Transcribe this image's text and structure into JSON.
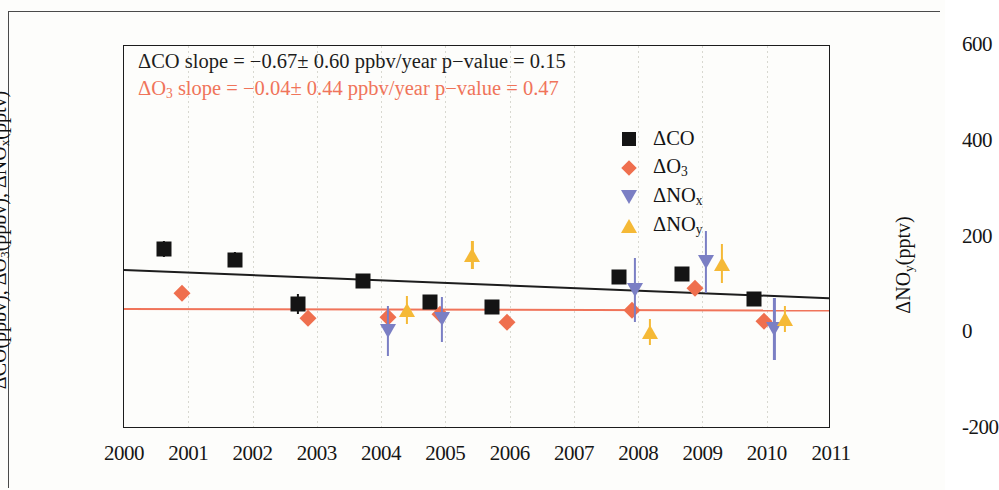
{
  "annotations": {
    "co_line": "ΔCO slope = −0.67± 0.60 ppbv/year   p−value = 0.15",
    "o3_line": "ΔO₃ slope = −0.04± 0.44 ppbv/year   p−value = 0.47",
    "co_color": "#1d1d1d",
    "o3_color": "#f0745a"
  },
  "legend": {
    "items": [
      {
        "label": "ΔCO",
        "marker": "square",
        "color": "#141414"
      },
      {
        "label": "ΔO₃",
        "marker": "diamond",
        "color": "#ef6f4e"
      },
      {
        "label": "ΔNOₓ",
        "marker": "triangle-down",
        "color": "#7b7fc4"
      },
      {
        "label": "ΔNOᵧ",
        "marker": "triangle-up",
        "color": "#f5b936"
      }
    ]
  },
  "chart_data": {
    "type": "scatter",
    "title": "",
    "xlabel": "",
    "ylabel": "ΔCO(ppbv), ΔO₃(ppbv), ΔNOₓ(pptv)",
    "ylabel_right": "ΔNOᵧ(pptv)",
    "xlim": [
      2000,
      2011
    ],
    "ylim": [
      -20,
      80
    ],
    "ylim_right": [
      -200,
      600
    ],
    "xticks": [
      2000,
      2001,
      2002,
      2003,
      2004,
      2005,
      2006,
      2007,
      2008,
      2009,
      2010,
      2011
    ],
    "xticklabels": [
      "2000",
      "2001",
      "2002",
      "2003",
      "2004",
      "2005",
      "2006",
      "2007",
      "2008",
      "2009",
      "2010",
      "2011"
    ],
    "yticks": [
      -20,
      0,
      20,
      40,
      60,
      80
    ],
    "yticklabels": [
      "-20",
      "0",
      "20",
      "40",
      "60",
      "80"
    ],
    "yticks_right": [
      -200,
      0,
      200,
      400,
      600
    ],
    "yticklabels_right": [
      "-200",
      "0",
      "200",
      "400",
      "600"
    ],
    "yminor_step": 5,
    "grid": "faint-vertical",
    "legend_position": "upper-right-inside",
    "series": [
      {
        "name": "ΔCO",
        "marker": "square",
        "color": "#141414",
        "points": [
          {
            "x": 2000.62,
            "y": 27.0,
            "yerr": 2.0
          },
          {
            "x": 2001.72,
            "y": 24.2,
            "yerr": 2.0
          },
          {
            "x": 2002.7,
            "y": 12.6,
            "yerr": 2.6
          },
          {
            "x": 2003.72,
            "y": 18.6,
            "yerr": 1.6
          },
          {
            "x": 2004.76,
            "y": 13.1,
            "yerr": 1.6
          },
          {
            "x": 2005.72,
            "y": 11.8,
            "yerr": 1.3
          },
          {
            "x": 2007.7,
            "y": 19.6,
            "yerr": 1.5
          },
          {
            "x": 2008.68,
            "y": 20.5,
            "yerr": 1.5
          },
          {
            "x": 2009.8,
            "y": 14.0,
            "yerr": 1.4
          }
        ]
      },
      {
        "name": "ΔO₃",
        "marker": "diamond",
        "color": "#ef6f4e",
        "points": [
          {
            "x": 2000.9,
            "y": 15.4,
            "yerr": 0
          },
          {
            "x": 2002.86,
            "y": 9.0,
            "yerr": 0
          },
          {
            "x": 2004.1,
            "y": 9.3,
            "yerr": 0
          },
          {
            "x": 2004.92,
            "y": 10.1,
            "yerr": 0
          },
          {
            "x": 2005.96,
            "y": 7.9,
            "yerr": 0
          },
          {
            "x": 2007.9,
            "y": 11.0,
            "yerr": 0
          },
          {
            "x": 2008.88,
            "y": 16.7,
            "yerr": 0
          },
          {
            "x": 2009.95,
            "y": 8.3,
            "yerr": 0
          }
        ]
      },
      {
        "name": "ΔNOₓ",
        "marker": "triangle-down",
        "color": "#7b7fc4",
        "points": [
          {
            "x": 2004.1,
            "y": 5.6,
            "yerr": 6.6
          },
          {
            "x": 2004.95,
            "y": 8.6,
            "yerr": 5.8
          },
          {
            "x": 2007.95,
            "y": 16.3,
            "yerr": 8.4
          },
          {
            "x": 2009.05,
            "y": 23.6,
            "yerr": 8.0
          },
          {
            "x": 2010.12,
            "y": 6.1,
            "yerr": 8.2
          }
        ]
      },
      {
        "name": "ΔNOᵧ",
        "marker": "triangle-up",
        "color": "#f5b936",
        "points": [
          {
            "x": 2004.4,
            "y": 11.0,
            "yerr": 3.6
          },
          {
            "x": 2005.42,
            "y": 25.4,
            "yerr": 3.6
          },
          {
            "x": 2008.18,
            "y": 5.4,
            "yerr": 3.4
          },
          {
            "x": 2009.3,
            "y": 23.2,
            "yerr": 5.0
          },
          {
            "x": 2010.28,
            "y": 8.6,
            "yerr": 3.4
          }
        ]
      }
    ],
    "trendlines": [
      {
        "name": "ΔCO trend",
        "color": "#1d1d1d",
        "x0": 2000,
        "y0": 21.8,
        "x1": 2011,
        "y1": 14.4,
        "slope": -0.67,
        "slope_err": 0.6,
        "p_value": 0.15,
        "units": "ppbv/year"
      },
      {
        "name": "ΔO₃ trend",
        "color": "#f0745a",
        "x0": 2000,
        "y0": 11.5,
        "x1": 2011,
        "y1": 11.1,
        "slope": -0.04,
        "slope_err": 0.44,
        "p_value": 0.47,
        "units": "ppbv/year"
      }
    ]
  }
}
